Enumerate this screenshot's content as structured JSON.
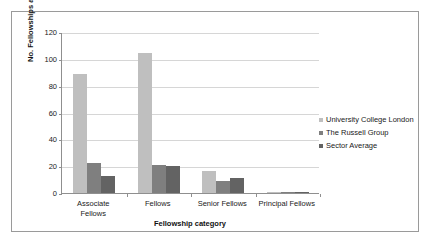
{
  "chart_data": {
    "type": "bar",
    "title": "",
    "xlabel": "Fellowship category",
    "ylabel": "No. Fellowships awarded",
    "categories": [
      "Associate Fellows",
      "Fellows",
      "Senior Fellows",
      "Principal Fellows"
    ],
    "category_lines": [
      [
        "Associate",
        "Fellows"
      ],
      [
        "Fellows"
      ],
      [
        "Senior Fellows"
      ],
      [
        "Principal Fellows"
      ]
    ],
    "series": [
      {
        "name": "University College London",
        "color": "#bfbfbf",
        "values": [
          89,
          104.5,
          16.5,
          0.5
        ]
      },
      {
        "name": "The Russell Group",
        "color": "#7f7f7f",
        "values": [
          22,
          21,
          9,
          0.5
        ]
      },
      {
        "name": "Sector Average",
        "color": "#636363",
        "values": [
          12.5,
          20.5,
          11.5,
          0.5
        ]
      }
    ],
    "ylim": [
      0,
      120
    ],
    "yticks": [
      0,
      20,
      40,
      60,
      80,
      100,
      120
    ],
    "ytick_labels": [
      "0",
      "20",
      "40",
      "60",
      "80",
      "100",
      "120"
    ],
    "grid": true,
    "grid_axis": "y",
    "legend_position": "right",
    "background": "#ffffff",
    "axis_color": "#8f8f8f",
    "grid_color": "#d6d6d6"
  }
}
